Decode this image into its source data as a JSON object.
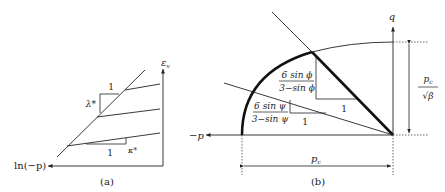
{
  "figure": {
    "panel_a": {
      "caption": "(a)",
      "x_axis_label": "ln(−p)",
      "y_axis_label": "ε",
      "y_axis_subscript": "v",
      "slope_lambda_label": "λ*",
      "slope_lambda_run": "1",
      "slope_kappa_label": "κ*",
      "slope_kappa_run": "1"
    },
    "panel_b": {
      "caption": "(b)",
      "x_axis_label": "−p",
      "y_axis_label": "q",
      "phi_slope_num": "6 sin ϕ",
      "phi_slope_den": "3−sin ϕ",
      "phi_slope_run": "1",
      "psi_slope_num": "6 sin ψ",
      "psi_slope_den": "3−sin ψ",
      "psi_slope_run": "1",
      "height_dim_num": "p",
      "height_dim_num_sub": "c",
      "height_dim_den": "√β",
      "width_dim_label": "p",
      "width_dim_label_sub": "c"
    },
    "colors": {
      "line": "#222222",
      "thick_line": "#111111",
      "dotted": "#444444"
    }
  }
}
